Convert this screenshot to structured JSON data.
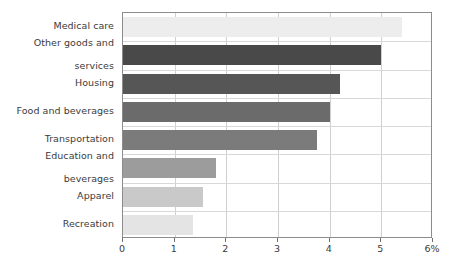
{
  "chart_data": {
    "type": "bar",
    "orientation": "horizontal",
    "title": "",
    "subtitle": "",
    "xlabel": "",
    "ylabel": "",
    "xlim": [
      0,
      6
    ],
    "xticks": [
      0,
      1,
      2,
      3,
      4,
      5,
      6
    ],
    "xtick_labels": [
      "0",
      "1",
      "2",
      "3",
      "4",
      "5",
      "6%"
    ],
    "grid": true,
    "legend": null,
    "categories": [
      "Medical care",
      "Other goods and services",
      "Housing",
      "Food and beverages",
      "Transportation",
      "Education and beverages",
      "Apparel",
      "Recreation"
    ],
    "values": [
      5.4,
      5.0,
      4.2,
      4.0,
      3.75,
      1.8,
      1.55,
      1.35
    ],
    "bar_colors": [
      "#ededed",
      "#494949",
      "#565656",
      "#6b6b6b",
      "#7b7b7b",
      "#9c9c9c",
      "#c9c9c9",
      "#e4e4e4"
    ]
  },
  "axis": {
    "frame_color": "#8c8c8c",
    "gridline_color": "#cfcfcf",
    "tick_color": "#6f6f6f",
    "label_color": "#3b3b3b"
  },
  "category_label_lines": [
    [
      "Medical care"
    ],
    [
      "Other goods and",
      "services"
    ],
    [
      "Housing"
    ],
    [
      "Food and beverages"
    ],
    [
      "Transportation"
    ],
    [
      "Education and",
      "beverages"
    ],
    [
      "Apparel"
    ],
    [
      "Recreation"
    ]
  ]
}
